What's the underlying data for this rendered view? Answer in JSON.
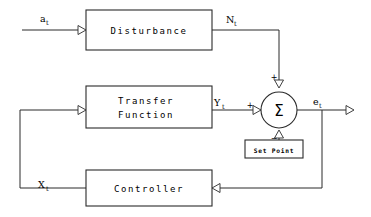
{
  "diagram": {
    "type": "control-system-block-diagram",
    "background_color": "#ffffff",
    "line_color": "#2b2b2b",
    "blocks": [
      {
        "id": "disturbance",
        "label": "Disturbance",
        "x": 86,
        "y": 10,
        "w": 126,
        "h": 40
      },
      {
        "id": "transfer_function",
        "label_line1": "Transfer",
        "label_line2": "Function",
        "x": 86,
        "y": 86,
        "w": 126,
        "h": 42
      },
      {
        "id": "controller",
        "label": "Controller",
        "x": 86,
        "y": 170,
        "w": 126,
        "h": 36
      },
      {
        "id": "set_point",
        "label": "Set Point",
        "x": 245,
        "y": 140,
        "w": 58,
        "h": 18
      }
    ],
    "summing_junction": {
      "id": "summer",
      "glyph": "Σ",
      "cx": 279,
      "cy": 110,
      "r": 18,
      "signs": {
        "top": "+",
        "left": "+",
        "bottom": "−"
      }
    },
    "signals": [
      {
        "id": "a_t",
        "base": "a",
        "subscript": "t",
        "x": 43,
        "y": 20
      },
      {
        "id": "N_t",
        "base": "N",
        "subscript": "t",
        "x": 230,
        "y": 21
      },
      {
        "id": "Y_t",
        "base": "Y",
        "subscript": "t",
        "x": 218,
        "y": 105
      },
      {
        "id": "e_t",
        "base": "e",
        "subscript": "t",
        "x": 316,
        "y": 104
      },
      {
        "id": "X_t",
        "base": "X",
        "subscript": "t",
        "x": 42,
        "y": 187
      }
    ],
    "connections": [
      {
        "from": "input-a_t",
        "to": "disturbance",
        "label": "a_t"
      },
      {
        "from": "disturbance",
        "to": "summer-top",
        "label": "N_t",
        "sign": "+"
      },
      {
        "from": "transfer_function",
        "to": "summer-left",
        "label": "Y_t",
        "sign": "+"
      },
      {
        "from": "set_point",
        "to": "summer-bottom",
        "sign": "−"
      },
      {
        "from": "summer",
        "to": "output-e_t",
        "label": "e_t"
      },
      {
        "from": "e_t-branch",
        "to": "controller",
        "label": ""
      },
      {
        "from": "controller",
        "to": "transfer_function",
        "label": "X_t"
      }
    ]
  }
}
